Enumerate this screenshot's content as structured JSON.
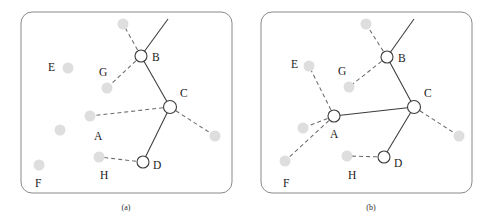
{
  "figure": {
    "title": "",
    "width": 496,
    "height": 223,
    "background": "#ffffff",
    "colors": {
      "panel_border": "#8a8a8a",
      "ghost_node_fill": "#dedede",
      "open_node_fill": "#ffffff",
      "open_node_stroke": "#3a3a3a",
      "solid_edge": "#3a3a3a",
      "dashed_edge": "#6b6b6b",
      "label_text": "#1a1a1a"
    }
  },
  "panels": [
    {
      "id": "panel-a",
      "caption": "(a)",
      "caption_pos": {
        "x": 126,
        "y": 210
      },
      "frame": {
        "x": 21,
        "y": 12,
        "width": 211,
        "height": 181,
        "rx": 11
      },
      "ghost_nodes": [
        {
          "name": "ghost-top",
          "x": 123,
          "y": 24,
          "r": 5.5
        },
        {
          "name": "ghost-e",
          "x": 68,
          "y": 68,
          "r": 5.5
        },
        {
          "name": "ghost-g",
          "x": 107,
          "y": 88,
          "r": 5.5
        },
        {
          "name": "ghost-a",
          "x": 90,
          "y": 116,
          "r": 5.5
        },
        {
          "name": "ghost-mid-left",
          "x": 60,
          "y": 130,
          "r": 5.5
        },
        {
          "name": "ghost-f",
          "x": 39,
          "y": 165,
          "r": 5.5
        },
        {
          "name": "ghost-h",
          "x": 99,
          "y": 157,
          "r": 5.5
        },
        {
          "name": "ghost-right",
          "x": 215,
          "y": 136,
          "r": 5.5
        }
      ],
      "open_nodes": [
        {
          "name": "node-b",
          "label": "B",
          "x": 141,
          "y": 56,
          "r": 6.0,
          "label_dx": 11,
          "label_dy": 5
        },
        {
          "name": "node-c",
          "label": "C",
          "x": 170,
          "y": 107,
          "r": 6.5,
          "label_dx": 10,
          "label_dy": -10
        },
        {
          "name": "node-d",
          "label": "D",
          "x": 143,
          "y": 162,
          "r": 6.0,
          "label_dx": 10,
          "label_dy": 7
        }
      ],
      "free_labels": [
        {
          "name": "label-e",
          "text": "E",
          "x": 48,
          "y": 71
        },
        {
          "name": "label-g",
          "text": "G",
          "x": 99,
          "y": 76
        },
        {
          "name": "label-a",
          "text": "A",
          "x": 94,
          "y": 140
        },
        {
          "name": "label-f",
          "text": "F",
          "x": 35,
          "y": 187
        },
        {
          "name": "label-h",
          "text": "H",
          "x": 100,
          "y": 179
        }
      ],
      "solid_edges": [
        {
          "name": "edge-b-up",
          "x1": 141,
          "y1": 56,
          "x2": 168,
          "y2": 19
        },
        {
          "name": "edge-b-c",
          "x1": 141,
          "y1": 56,
          "x2": 170,
          "y2": 107
        },
        {
          "name": "edge-c-d",
          "x1": 170,
          "y1": 107,
          "x2": 143,
          "y2": 162
        }
      ],
      "dashed_edges": [
        {
          "name": "edge-b-ghosttop",
          "x1": 141,
          "y1": 56,
          "x2": 123,
          "y2": 24
        },
        {
          "name": "edge-b-ghostg",
          "x1": 141,
          "y1": 56,
          "x2": 107,
          "y2": 88
        },
        {
          "name": "edge-c-ghosta",
          "x1": 170,
          "y1": 107,
          "x2": 90,
          "y2": 116
        },
        {
          "name": "edge-c-ghostright",
          "x1": 170,
          "y1": 107,
          "x2": 215,
          "y2": 136
        },
        {
          "name": "edge-d-ghosth",
          "x1": 143,
          "y1": 162,
          "x2": 99,
          "y2": 157
        }
      ]
    },
    {
      "id": "panel-b",
      "caption": "(b)",
      "caption_pos": {
        "x": 371,
        "y": 210
      },
      "frame": {
        "x": 261,
        "y": 12,
        "width": 211,
        "height": 181,
        "rx": 11
      },
      "ghost_nodes": [
        {
          "name": "ghost-top",
          "x": 366,
          "y": 24,
          "r": 5.5
        },
        {
          "name": "ghost-e",
          "x": 309,
          "y": 66,
          "r": 5.5
        },
        {
          "name": "ghost-g",
          "x": 349,
          "y": 87,
          "r": 5.5
        },
        {
          "name": "ghost-mid-left",
          "x": 303,
          "y": 128,
          "r": 5.5
        },
        {
          "name": "ghost-f",
          "x": 285,
          "y": 161,
          "r": 5.5
        },
        {
          "name": "ghost-h",
          "x": 347,
          "y": 156,
          "r": 5.5
        },
        {
          "name": "ghost-right",
          "x": 459,
          "y": 136,
          "r": 5.5
        }
      ],
      "open_nodes": [
        {
          "name": "node-b",
          "label": "B",
          "x": 387,
          "y": 57,
          "r": 6.0,
          "label_dx": 11,
          "label_dy": 5
        },
        {
          "name": "node-c",
          "label": "C",
          "x": 414,
          "y": 107,
          "r": 6.5,
          "label_dx": 10,
          "label_dy": -10
        },
        {
          "name": "node-a",
          "label": "A",
          "x": 334,
          "y": 116,
          "r": 6.0,
          "label_dx": -4,
          "label_dy": 22
        },
        {
          "name": "node-d",
          "label": "D",
          "x": 384,
          "y": 157,
          "r": 6.0,
          "label_dx": 10,
          "label_dy": 10
        }
      ],
      "free_labels": [
        {
          "name": "label-e",
          "text": "E",
          "x": 291,
          "y": 68
        },
        {
          "name": "label-g",
          "text": "G",
          "x": 338,
          "y": 75
        },
        {
          "name": "label-f",
          "text": "F",
          "x": 283,
          "y": 187
        },
        {
          "name": "label-h",
          "text": "H",
          "x": 348,
          "y": 179
        }
      ],
      "solid_edges": [
        {
          "name": "edge-b-up",
          "x1": 387,
          "y1": 57,
          "x2": 414,
          "y2": 19
        },
        {
          "name": "edge-b-c",
          "x1": 387,
          "y1": 57,
          "x2": 414,
          "y2": 107
        },
        {
          "name": "edge-a-c",
          "x1": 334,
          "y1": 116,
          "x2": 414,
          "y2": 107
        },
        {
          "name": "edge-c-d",
          "x1": 414,
          "y1": 107,
          "x2": 384,
          "y2": 157
        }
      ],
      "dashed_edges": [
        {
          "name": "edge-b-ghosttop",
          "x1": 387,
          "y1": 57,
          "x2": 366,
          "y2": 24
        },
        {
          "name": "edge-b-ghostg",
          "x1": 387,
          "y1": 57,
          "x2": 349,
          "y2": 87
        },
        {
          "name": "edge-a-ghoste",
          "x1": 334,
          "y1": 116,
          "x2": 309,
          "y2": 66
        },
        {
          "name": "edge-a-ghostmidleft",
          "x1": 334,
          "y1": 116,
          "x2": 303,
          "y2": 128
        },
        {
          "name": "edge-a-ghostf",
          "x1": 334,
          "y1": 116,
          "x2": 285,
          "y2": 161
        },
        {
          "name": "edge-c-ghostright",
          "x1": 414,
          "y1": 107,
          "x2": 459,
          "y2": 136
        },
        {
          "name": "edge-d-ghosth",
          "x1": 384,
          "y1": 157,
          "x2": 347,
          "y2": 156
        }
      ]
    }
  ],
  "chart_data": {
    "type": "diagram",
    "subtype": "node-link-graph-pair",
    "title": "",
    "panel_labels": [
      "(a)",
      "(b)"
    ],
    "node_types": {
      "open_circle": "selected / active node (white fill, dark outline)",
      "gray_dot": "unselected / candidate node (light gray fill)"
    },
    "edge_types": {
      "solid": "confirmed link",
      "dashed": "candidate link"
    },
    "panels": [
      {
        "label": "(a)",
        "open_nodes": [
          "B",
          "C",
          "D"
        ],
        "gray_nodes": [
          "E",
          "G",
          "A",
          "F",
          "H"
        ],
        "solid_edges": [
          [
            "B",
            "open-boundary"
          ],
          [
            "B",
            "C"
          ],
          [
            "C",
            "D"
          ]
        ],
        "dashed_edges": [
          [
            "B",
            "gray-top"
          ],
          [
            "B",
            "G"
          ],
          [
            "C",
            "A"
          ],
          [
            "C",
            "gray-right"
          ],
          [
            "D",
            "H"
          ]
        ]
      },
      {
        "label": "(b)",
        "open_nodes": [
          "B",
          "C",
          "A",
          "D"
        ],
        "gray_nodes": [
          "E",
          "G",
          "F",
          "H"
        ],
        "solid_edges": [
          [
            "B",
            "open-boundary"
          ],
          [
            "B",
            "C"
          ],
          [
            "A",
            "C"
          ],
          [
            "C",
            "D"
          ]
        ],
        "dashed_edges": [
          [
            "B",
            "gray-top"
          ],
          [
            "B",
            "G"
          ],
          [
            "A",
            "E"
          ],
          [
            "A",
            "gray-left"
          ],
          [
            "A",
            "F"
          ],
          [
            "C",
            "gray-right"
          ],
          [
            "D",
            "H"
          ]
        ]
      }
    ]
  }
}
